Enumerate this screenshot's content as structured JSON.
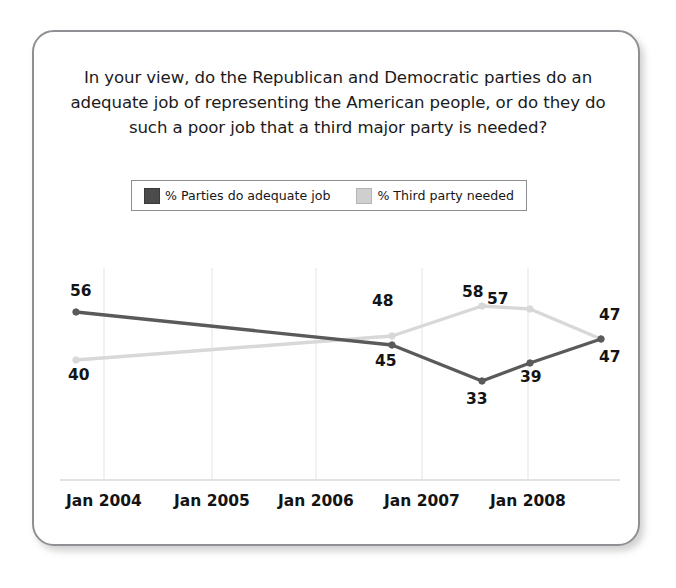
{
  "card": {
    "title": "In your view, do the Republican and Democratic parties do an adequate job of representing the American people, or do they do such a poor job that a third major party is needed?"
  },
  "legend": {
    "entries": [
      {
        "label": "% Parties do adequate job",
        "swatch": "dark",
        "color": "#4b4b4b"
      },
      {
        "label": "% Third party needed",
        "swatch": "light",
        "color": "#cfcfcf"
      }
    ]
  },
  "colors": {
    "dark_line": "#5a5a5a",
    "light_line": "#d8d8d8",
    "gridline": "#ebebeb",
    "axis": "#e2e2e2",
    "card_border": "#8f9093",
    "text": "#141414"
  },
  "chart_data": {
    "type": "line",
    "title": "In your view, do the Republican and Democratic parties do an adequate job of representing the American people, or do they do such a poor job that a third major party is needed?",
    "xlabel": "",
    "ylabel": "",
    "grid": true,
    "legend_position": "top",
    "ylim": [
      30,
      60
    ],
    "tick_labels": [
      "Jan 2004",
      "Jan 2005",
      "Jan 2006",
      "Jan 2007",
      "Jan 2008"
    ],
    "x_positions_px": [
      76,
      392,
      482,
      530,
      601
    ],
    "gridline_positions_px": [
      104,
      212,
      316,
      422,
      528
    ],
    "series": [
      {
        "name": "% Parties do adequate job",
        "color": "#5a5a5a",
        "values": [
          56,
          45,
          33,
          39,
          47
        ],
        "point_labels": [
          "56",
          "45",
          "33",
          "39",
          "47"
        ]
      },
      {
        "name": "% Third party needed",
        "color": "#d8d8d8",
        "values": [
          40,
          48,
          58,
          57,
          47
        ],
        "point_labels": [
          "40",
          "48",
          "58",
          "57",
          "47"
        ]
      }
    ]
  },
  "value_labels": [
    {
      "text": "56",
      "x": 70,
      "y": 282
    },
    {
      "text": "40",
      "x": 68,
      "y": 366
    },
    {
      "text": "48",
      "x": 372,
      "y": 292
    },
    {
      "text": "45",
      "x": 375,
      "y": 352
    },
    {
      "text": "58",
      "x": 462,
      "y": 283
    },
    {
      "text": "33",
      "x": 466,
      "y": 390
    },
    {
      "text": "57",
      "x": 487,
      "y": 290
    },
    {
      "text": "39",
      "x": 520,
      "y": 368
    },
    {
      "text": "47",
      "x": 599,
      "y": 306
    },
    {
      "text": "47",
      "x": 599,
      "y": 348
    }
  ]
}
